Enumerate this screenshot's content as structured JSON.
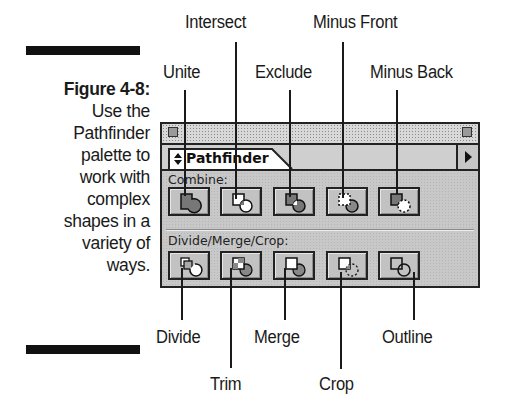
{
  "caption": {
    "figure": "Figure 4-8:",
    "lines": [
      "Use the",
      "Pathfinder",
      "palette to",
      "work with",
      "complex",
      "shapes in a",
      "variety of",
      "ways."
    ]
  },
  "callouts": {
    "top": {
      "unite": "Unite",
      "intersect": "Intersect",
      "exclude": "Exclude",
      "minus_front": "Minus Front",
      "minus_back": "Minus Back"
    },
    "bottom": {
      "divide": "Divide",
      "trim": "Trim",
      "merge": "Merge",
      "crop": "Crop",
      "outline": "Outline"
    }
  },
  "palette": {
    "tab_label": "Pathfinder",
    "tab_icon": "up-down-arrows-icon",
    "menu_icon": "triangle-right-icon",
    "sections": [
      {
        "label": "Combine:",
        "buttons": [
          "unite",
          "intersect",
          "exclude",
          "minus-front",
          "minus-back"
        ]
      },
      {
        "label": "Divide/Merge/Crop:",
        "buttons": [
          "divide",
          "trim",
          "merge",
          "crop",
          "outline"
        ]
      }
    ]
  },
  "colors": {
    "panel_bg": "#c8c8c8",
    "border": "#222222",
    "text": "#1a1a1a"
  }
}
